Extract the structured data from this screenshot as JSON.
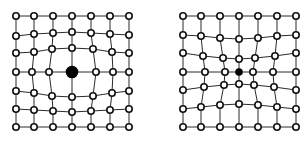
{
  "figure": {
    "panels": [
      {
        "id": "left",
        "label": "grid-large-center-node",
        "rows": 7,
        "cols": 7,
        "center_radius": 5.5,
        "node_radius": 3.2,
        "center_index": [
          3,
          3
        ],
        "nodes": [
          [
            [
              16,
              16
            ],
            [
              34,
              16
            ],
            [
              53,
              16
            ],
            [
              72,
              16
            ],
            [
              91,
              16
            ],
            [
              110,
              16
            ],
            [
              129,
              16
            ]
          ],
          [
            [
              16,
              36
            ],
            [
              34,
              34
            ],
            [
              53,
              33
            ],
            [
              72,
              32
            ],
            [
              91,
              33
            ],
            [
              110,
              34
            ],
            [
              129,
              35
            ]
          ],
          [
            [
              16,
              53
            ],
            [
              34,
              52
            ],
            [
              52,
              49
            ],
            [
              72,
              48
            ],
            [
              93,
              49
            ],
            [
              112,
              52
            ],
            [
              129,
              53
            ]
          ],
          [
            [
              16,
              72
            ],
            [
              32,
              72
            ],
            [
              49,
              72
            ],
            [
              72,
              72
            ],
            [
              96,
              72
            ],
            [
              113,
              72
            ],
            [
              129,
              72
            ]
          ],
          [
            [
              16,
              91
            ],
            [
              34,
              93
            ],
            [
              52,
              96
            ],
            [
              72,
              97
            ],
            [
              93,
              96
            ],
            [
              112,
              93
            ],
            [
              129,
              91
            ]
          ],
          [
            [
              16,
              109
            ],
            [
              34,
              110
            ],
            [
              53,
              111
            ],
            [
              72,
              112
            ],
            [
              91,
              111
            ],
            [
              110,
              110
            ],
            [
              129,
              109
            ]
          ],
          [
            [
              16,
              127
            ],
            [
              34,
              127
            ],
            [
              53,
              127
            ],
            [
              72,
              127
            ],
            [
              91,
              127
            ],
            [
              110,
              127
            ],
            [
              129,
              127
            ]
          ]
        ]
      },
      {
        "id": "right",
        "label": "grid-small-center-node",
        "rows": 7,
        "cols": 7,
        "center_radius": 3,
        "node_radius": 3.2,
        "center_index": [
          3,
          3
        ],
        "nodes": [
          [
            [
              183,
              16
            ],
            [
              201,
              16
            ],
            [
              220,
              16
            ],
            [
              239,
              16
            ],
            [
              258,
              16
            ],
            [
              277,
              16
            ],
            [
              296,
              16
            ]
          ],
          [
            [
              183,
              35
            ],
            [
              201,
              36
            ],
            [
              220,
              38
            ],
            [
              239,
              39
            ],
            [
              258,
              38
            ],
            [
              277,
              36
            ],
            [
              296,
              35
            ]
          ],
          [
            [
              183,
              53
            ],
            [
              203,
              56
            ],
            [
              223,
              58
            ],
            [
              239,
              59
            ],
            [
              255,
              58
            ],
            [
              275,
              56
            ],
            [
              296,
              53
            ]
          ],
          [
            [
              183,
              72
            ],
            [
              205,
              72
            ],
            [
              225,
              72
            ],
            [
              239,
              72
            ],
            [
              253,
              72
            ],
            [
              273,
              72
            ],
            [
              296,
              72
            ]
          ],
          [
            [
              183,
              90
            ],
            [
              204,
              87
            ],
            [
              224,
              85
            ],
            [
              239,
              84
            ],
            [
              254,
              85
            ],
            [
              274,
              87
            ],
            [
              296,
              90
            ]
          ],
          [
            [
              183,
              109
            ],
            [
              201,
              107
            ],
            [
              220,
              105
            ],
            [
              239,
              104
            ],
            [
              258,
              105
            ],
            [
              277,
              107
            ],
            [
              296,
              109
            ]
          ],
          [
            [
              183,
              127
            ],
            [
              201,
              127
            ],
            [
              220,
              127
            ],
            [
              239,
              127
            ],
            [
              258,
              127
            ],
            [
              277,
              127
            ],
            [
              296,
              127
            ]
          ]
        ]
      }
    ],
    "colors": {
      "background": "#ffffff",
      "edge": "#2a2a2a",
      "node_fill": "#ffffff",
      "node_stroke": "#111111",
      "center_fill": "#000000"
    }
  }
}
